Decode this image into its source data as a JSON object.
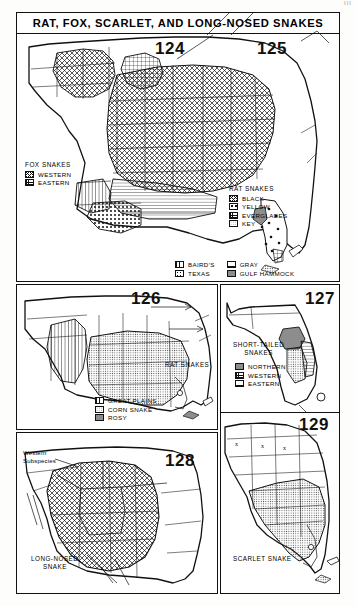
{
  "page": {
    "corner_mark": "III",
    "title": "RAT, FOX, SCARLET, AND LONG-NOSED SNAKES"
  },
  "panels": [
    {
      "id": "p124",
      "number": "124"
    },
    {
      "id": "p125",
      "number": "125"
    },
    {
      "id": "p126",
      "number": "126"
    },
    {
      "id": "p127",
      "number": "127"
    },
    {
      "id": "p128",
      "number": "128"
    },
    {
      "id": "p129",
      "number": "129"
    }
  ],
  "legends": {
    "fox_snakes": {
      "title": "FOX SNAKES",
      "items": [
        {
          "label": "WESTERN",
          "pattern": "crosshatch"
        },
        {
          "label": "EASTERN",
          "pattern": "grid"
        }
      ]
    },
    "rat_snakes_top": {
      "title": "RAT SNAKES",
      "items": [
        {
          "label": "BLACK",
          "pattern": "crosshatch"
        },
        {
          "label": "YELLOW",
          "pattern": "coarse-dots"
        },
        {
          "label": "EVERGLADES",
          "pattern": "grid"
        },
        {
          "label": "KEY",
          "pattern": "stipple"
        }
      ]
    },
    "rat_snakes_bottom_bar": {
      "items": [
        {
          "label": "BAIRD'S",
          "pattern": "vlines"
        },
        {
          "label": "GRAY",
          "pattern": "hlines"
        },
        {
          "label": "TEXAS",
          "pattern": "dots"
        },
        {
          "label": "GULF HAMMOCK",
          "pattern": "gray"
        }
      ]
    },
    "rat_snakes_126": {
      "title": "RAT SNAKES",
      "items": [
        {
          "label": "GREAT PLAINS",
          "pattern": "vlines"
        },
        {
          "label": "CORN SNAKE",
          "pattern": "stipple"
        },
        {
          "label": "ROSY",
          "pattern": "gray"
        }
      ]
    },
    "short_tailed": {
      "title_line1": "SHORT-TAILED",
      "title_line2": "SNAKES",
      "items": [
        {
          "label": "NORTHERN",
          "pattern": "gray"
        },
        {
          "label": "WESTERN",
          "pattern": "grid"
        },
        {
          "label": "EASTERN",
          "pattern": "hlines"
        }
      ]
    }
  },
  "map_labels": {
    "western_subspecies_line1": "Western",
    "western_subspecies_line2": "Subspecies",
    "long_nosed_line1": "LONG-NOSED",
    "long_nosed_line2": "SNAKE",
    "scarlet_snake": "SCARLET SNAKE"
  },
  "marks": {
    "x_symbol": "x"
  }
}
